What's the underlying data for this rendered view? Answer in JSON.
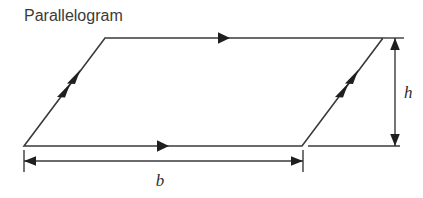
{
  "figure": {
    "title": "Parallelogram",
    "shape_name": "parallelogram",
    "background_color": "#ffffff",
    "stroke_color": "#3a3a3a",
    "title_color": "#3a3a3a",
    "label_color": "#2e2e2e",
    "labels": {
      "base": "b",
      "height": "h"
    },
    "geometry": {
      "vertices": {
        "bottom_left": [
          24,
          146
        ],
        "top_left": [
          105,
          38
        ],
        "top_right": [
          383,
          38
        ],
        "bottom_right": [
          302,
          146
        ]
      },
      "base_extension_line": [
        [
          308,
          146
        ],
        [
          400,
          146
        ]
      ],
      "height_dimension_line": {
        "x": 395,
        "y_top": 38,
        "y_bottom": 146
      },
      "base_dimension_line": {
        "y": 161,
        "x_left": 24,
        "x_right": 303
      }
    },
    "edge_markers": {
      "top_edge_arrows": 1,
      "bottom_edge_arrows": 1,
      "left_edge_arrows": 2,
      "right_edge_arrows": 2
    },
    "label_positions": {
      "base": [
        160,
        184
      ],
      "height": [
        404,
        98
      ]
    }
  }
}
